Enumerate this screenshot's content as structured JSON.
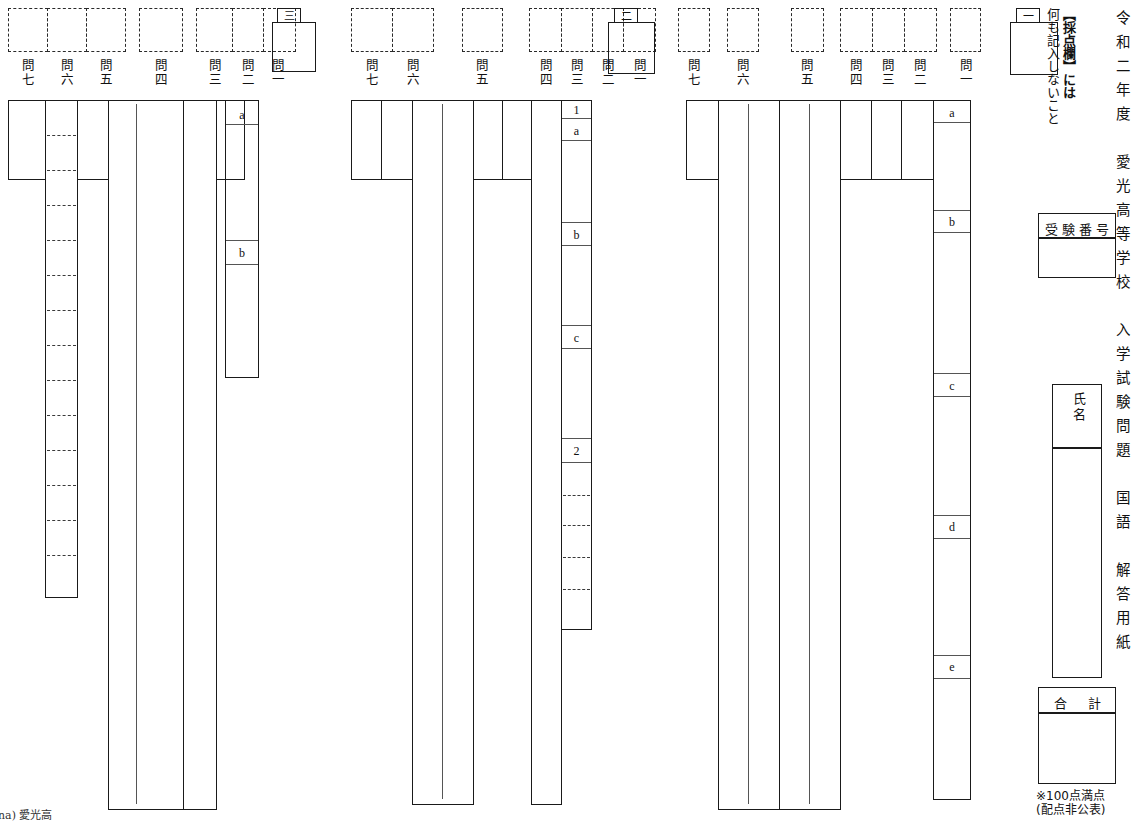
{
  "document": {
    "header_vertical": "令和二年度　愛光高等学校　入学試験問題　国語　解答用紙",
    "header_chars": [
      "令",
      "和",
      "二",
      "年",
      "度",
      "愛",
      "光",
      "高",
      "等",
      "学",
      "校",
      "入",
      "学",
      "試",
      "験",
      "問",
      "題",
      "国",
      "語",
      "解",
      "答",
      "用",
      "紙"
    ],
    "warning_note": "【採点欄】には何も記入しないこと",
    "warning_line1": "【採点欄】には",
    "warning_line2": "何も記入しないこと",
    "exam_number_label": "受験番号",
    "name_label": "氏名",
    "name_label_chars": [
      "氏",
      "名"
    ],
    "total_label": "合　計",
    "score_note_line1": "※100点満点",
    "score_note_line2": "(配点非公表)",
    "corner_text": "na) 愛光高"
  },
  "sections": [
    {
      "id": "section-three",
      "mark": "三",
      "score_boxes": [
        {
          "group": "g1",
          "count": 3
        },
        {
          "group": "g2",
          "count": 1
        },
        {
          "group": "g3",
          "count": 3
        }
      ],
      "question_labels": [
        {
          "name": "問七",
          "chars": [
            "問",
            "七"
          ]
        },
        {
          "name": "問六",
          "chars": [
            "問",
            "六"
          ]
        },
        {
          "name": "問五",
          "chars": [
            "問",
            "五"
          ]
        },
        {
          "name": "問四",
          "chars": [
            "問",
            "四"
          ]
        },
        {
          "name": "問三",
          "chars": [
            "問",
            "三"
          ]
        },
        {
          "name": "問二",
          "chars": [
            "問",
            "二"
          ]
        },
        {
          "name": "問一",
          "chars": [
            "問",
            "一"
          ]
        }
      ],
      "answer_sublabels": [
        "a",
        "b"
      ]
    },
    {
      "id": "section-two",
      "mark": "二",
      "score_boxes": [
        {
          "group": "g1",
          "count": 2
        },
        {
          "group": "g2",
          "count": 1
        },
        {
          "group": "g3",
          "count": 4
        }
      ],
      "question_labels": [
        {
          "name": "問七",
          "chars": [
            "問",
            "七"
          ]
        },
        {
          "name": "問六",
          "chars": [
            "問",
            "六"
          ]
        },
        {
          "name": "問五",
          "chars": [
            "問",
            "五"
          ]
        },
        {
          "name": "問四",
          "chars": [
            "問",
            "四"
          ]
        },
        {
          "name": "問三",
          "chars": [
            "問",
            "三"
          ]
        },
        {
          "name": "問二",
          "chars": [
            "問",
            "二"
          ]
        },
        {
          "name": "問一",
          "chars": [
            "問",
            "一"
          ]
        }
      ],
      "answer_sublabels": [
        "1",
        "a",
        "b",
        "c",
        "2"
      ]
    },
    {
      "id": "section-one",
      "mark": "一",
      "score_boxes": [
        {
          "group": "g1",
          "count": 2
        },
        {
          "group": "g2",
          "count": 1
        },
        {
          "group": "g3",
          "count": 3
        },
        {
          "group": "g4",
          "count": 1
        }
      ],
      "question_labels": [
        {
          "name": "問七",
          "chars": [
            "問",
            "七"
          ]
        },
        {
          "name": "問六",
          "chars": [
            "問",
            "六"
          ]
        },
        {
          "name": "問五",
          "chars": [
            "問",
            "五"
          ]
        },
        {
          "name": "問四",
          "chars": [
            "問",
            "四"
          ]
        },
        {
          "name": "問三",
          "chars": [
            "問",
            "三"
          ]
        },
        {
          "name": "問二",
          "chars": [
            "問",
            "二"
          ]
        },
        {
          "name": "問一",
          "chars": [
            "問",
            "一"
          ]
        }
      ],
      "answer_sublabels": [
        "a",
        "b",
        "c",
        "d",
        "e"
      ]
    }
  ]
}
